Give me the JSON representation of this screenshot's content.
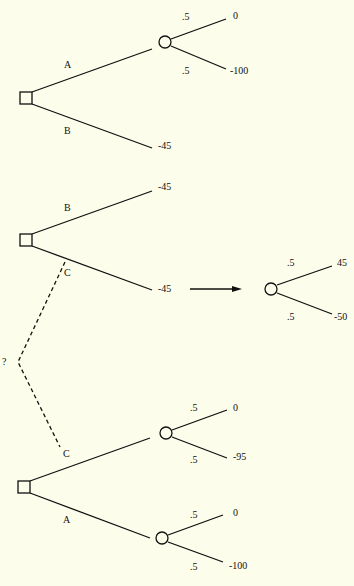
{
  "diagram": {
    "type": "decision-tree",
    "colors": {
      "background": "#fdfdeb",
      "ink": "#111111"
    },
    "trees": [
      {
        "id": "tree-top",
        "decision_node": {
          "shape": "square"
        },
        "branches": [
          {
            "label": "A",
            "chance_node": true,
            "outcomes": [
              {
                "prob": ".5",
                "value": "0"
              },
              {
                "prob": ".5",
                "value": "-100"
              }
            ]
          },
          {
            "label": "B",
            "terminal_value": "-45"
          }
        ]
      },
      {
        "id": "tree-middle",
        "decision_node": {
          "shape": "square"
        },
        "branches": [
          {
            "label": "B",
            "terminal_value": "-45"
          },
          {
            "label": "C",
            "terminal_value": "-45"
          }
        ],
        "expansion": {
          "arrow_from": "C",
          "outcomes": [
            {
              "prob": ".5",
              "value": "45"
            },
            {
              "prob": ".5",
              "value": "-50"
            }
          ]
        }
      },
      {
        "id": "tree-bottom",
        "decision_node": {
          "shape": "square"
        },
        "branches": [
          {
            "label": "C",
            "chance_node": true,
            "outcomes": [
              {
                "prob": ".5",
                "value": "0"
              },
              {
                "prob": ".5",
                "value": "-95"
              }
            ]
          },
          {
            "label": "A",
            "chance_node": true,
            "outcomes": [
              {
                "prob": ".5",
                "value": "0"
              },
              {
                "prob": ".5",
                "value": "-100"
              }
            ]
          }
        ]
      }
    ],
    "link": {
      "style": "dashed",
      "label": "?"
    }
  },
  "labels": {
    "t1_a": "A",
    "t1_b": "B",
    "t1_p1": ".5",
    "t1_p2": ".5",
    "t1_v1": "0",
    "t1_v2": "-100",
    "t1_vb": "-45",
    "t2_b": "B",
    "t2_c": "C",
    "t2_vb": "-45",
    "t2_vc": "-45",
    "t2x_p1": ".5",
    "t2x_p2": ".5",
    "t2x_v1": "45",
    "t2x_v2": "-50",
    "q": "?",
    "t3_c": "C",
    "t3_a": "A",
    "t3_p1": ".5",
    "t3_p2": ".5",
    "t3_v1": "0",
    "t3_v2": "-95",
    "t3_p3": ".5",
    "t3_p4": ".5",
    "t3_v3": "0",
    "t3_v4": "-100"
  }
}
